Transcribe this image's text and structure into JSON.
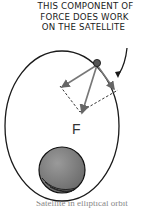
{
  "diagram": {
    "annotation_lines": [
      "THIS COMPONENT OF",
      "FORCE DOES WORK",
      "ON THE SATELLITE"
    ],
    "force_label": "F",
    "caption_fragment": "Satellite in elliptical orbit",
    "elements": {
      "orbit": "ellipse",
      "satellite": "small dark sphere on orbit",
      "planet": "gray shaded sphere near bottom of orbit",
      "force_vector": "arrow from satellite toward planet labeled F",
      "components": [
        "perpendicular component (left arrow)",
        "tangential component (right arrow)"
      ],
      "construction_lines": "dashed parallelogram"
    },
    "colors": {
      "line": "#222222",
      "arrow": "#777777",
      "planet": "#8a8a8a",
      "satellite": "#555555"
    }
  }
}
